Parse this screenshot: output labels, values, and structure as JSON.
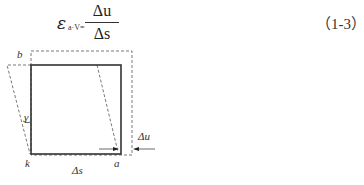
{
  "equation": {
    "symbol": "ε",
    "subscript": "a·V=",
    "numerator": "Δu",
    "denominator": "Δs",
    "number": "（1-3）"
  },
  "figure": {
    "labels": {
      "b": "b",
      "k": "k",
      "a": "a",
      "gamma": "γ",
      "delta_s": "Δs",
      "delta_u": "Δu"
    }
  }
}
